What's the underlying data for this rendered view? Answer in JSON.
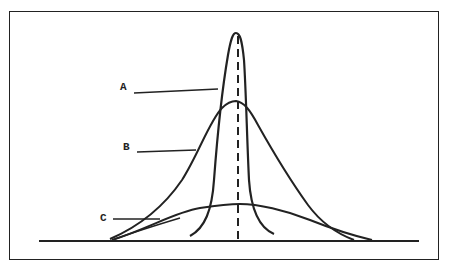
{
  "diagram": {
    "type": "overlapping-distribution-curves",
    "frame": {
      "visible": true
    },
    "baseline": {
      "visible": true
    },
    "center_line": {
      "style": "dashed"
    },
    "curves": [
      {
        "id": "A",
        "label": "A",
        "description": "tall narrow peaked curve"
      },
      {
        "id": "B",
        "label": "B",
        "description": "medium height, medium spread curve"
      },
      {
        "id": "C",
        "label": "C",
        "description": "low, wide flat curve"
      }
    ],
    "colors": {
      "stroke": "#222222",
      "background": "#ffffff"
    }
  }
}
